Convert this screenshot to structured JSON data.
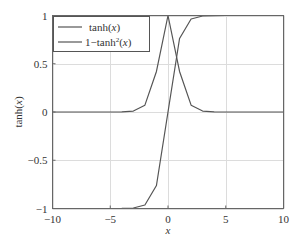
{
  "chart_data": {
    "type": "line",
    "title": "",
    "xlabel": "x",
    "ylabel": "tanh(x)",
    "xlim": [
      -10,
      10
    ],
    "ylim": [
      -1,
      1
    ],
    "grid": true,
    "legend_position": "upper left",
    "x_ticks": [
      -10,
      -5,
      0,
      5,
      10
    ],
    "x_tick_labels": [
      "−10",
      "−5",
      "0",
      "5",
      "10"
    ],
    "y_ticks": [
      -1,
      -0.5,
      0,
      0.5,
      1
    ],
    "y_tick_labels": [
      "−1",
      "−0.5",
      "0",
      "0.5",
      "1"
    ],
    "x": [
      -10,
      -9,
      -8,
      -7,
      -6,
      -5,
      -4,
      -3,
      -2,
      -1,
      0,
      1,
      2,
      3,
      4,
      5,
      6,
      7,
      8,
      9,
      10
    ],
    "series": [
      {
        "name": "tanh(x)",
        "values": [
          -1,
          -1,
          -1,
          -1,
          -1,
          -0.9999,
          -0.9993,
          -0.9951,
          -0.964,
          -0.7616,
          0,
          0.7616,
          0.964,
          0.9951,
          0.9993,
          0.9999,
          1,
          1,
          1,
          1,
          1
        ]
      },
      {
        "name": "1−tanh²(x)",
        "values": [
          0,
          0,
          0,
          0,
          0,
          0.0002,
          0.0013,
          0.0099,
          0.0707,
          0.42,
          1,
          0.42,
          0.0707,
          0.0099,
          0.0013,
          0.0002,
          0,
          0,
          0,
          0,
          0
        ]
      }
    ]
  },
  "legend": {
    "entry_1": "tanh(x)",
    "entry_2": "1−tanh²(x)"
  },
  "axes": {
    "xlabel": "x",
    "ylabel": "tanh(x)"
  },
  "colors": {
    "line": "#555555",
    "grid": "#dcdcdc",
    "frame": "#666666"
  }
}
